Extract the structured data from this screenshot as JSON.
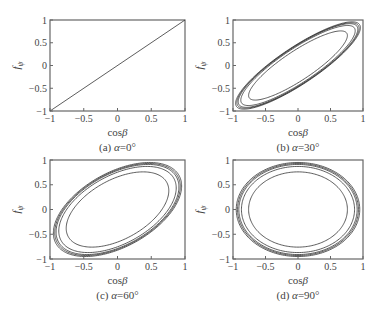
{
  "figure": {
    "x_ticks": [
      "-1",
      "-0.5",
      "0",
      "0.5",
      "1"
    ],
    "y_ticks": [
      "1",
      "0.5",
      "0",
      "-0.5",
      "-1"
    ],
    "xlabel": "cosβ",
    "ylabel": "fψ"
  },
  "chart_data": [
    {
      "type": "line",
      "panel": "a",
      "caption": "(a) α=0°",
      "alpha_deg": 0,
      "xlabel": "cosβ",
      "ylabel": "fψ",
      "xlim": [
        -1,
        1
      ],
      "ylim": [
        -1,
        1
      ],
      "x_ticks": [
        -1,
        -0.5,
        0,
        0.5,
        1
      ],
      "y_ticks": [
        -1,
        -0.5,
        0,
        0.5,
        1
      ],
      "series": [
        {
          "name": "diagonal",
          "x": [
            -1,
            1
          ],
          "y": [
            -1,
            1
          ]
        }
      ],
      "frame": {
        "x": 50,
        "y": 20,
        "w": 135,
        "h": 91
      },
      "amplitudes": [
        1.0
      ]
    },
    {
      "type": "line",
      "panel": "b",
      "caption": "(b) α=30°",
      "alpha_deg": 30,
      "xlabel": "cosβ",
      "ylabel": "fψ",
      "xlim": [
        -1,
        1
      ],
      "ylim": [
        -1,
        1
      ],
      "x_ticks": [
        -1,
        -0.5,
        0,
        0.5,
        1
      ],
      "y_ticks": [
        -1,
        -0.5,
        0,
        0.5,
        1
      ],
      "series_description": "Nested tilted ellipses x=A·cos t, y=A·cos(t-α)",
      "frame": {
        "x": 233,
        "y": 20,
        "w": 130,
        "h": 91
      },
      "amplitudes": [
        0.76,
        0.88,
        0.92,
        0.94,
        0.96
      ]
    },
    {
      "type": "line",
      "panel": "c",
      "caption": "(c) α=60°",
      "alpha_deg": 60,
      "xlabel": "cosβ",
      "ylabel": "fψ",
      "xlim": [
        -1,
        1
      ],
      "ylim": [
        -1,
        1
      ],
      "x_ticks": [
        -1,
        -0.5,
        0,
        0.5,
        1
      ],
      "y_ticks": [
        -1,
        -0.5,
        0,
        0.5,
        1
      ],
      "series_description": "Nested tilted ellipses x=A·cos t, y=A·cos(t-α)",
      "frame": {
        "x": 50,
        "y": 160,
        "w": 135,
        "h": 99
      },
      "amplitudes": [
        0.76,
        0.87,
        0.91,
        0.93,
        0.95
      ]
    },
    {
      "type": "line",
      "panel": "d",
      "caption": "(d) α=90°",
      "alpha_deg": 90,
      "xlabel": "cosβ",
      "ylabel": "fψ",
      "xlim": [
        -1,
        1
      ],
      "ylim": [
        -1,
        1
      ],
      "x_ticks": [
        -1,
        -0.5,
        0,
        0.5,
        1
      ],
      "y_ticks": [
        -1,
        -0.5,
        0,
        0.5,
        1
      ],
      "series_description": "Nested axis-aligned ellipses x=A·cos t, y=A·sin t",
      "frame": {
        "x": 233,
        "y": 160,
        "w": 130,
        "h": 99
      },
      "amplitudes": [
        0.76,
        0.87,
        0.91,
        0.93,
        0.95
      ]
    }
  ]
}
